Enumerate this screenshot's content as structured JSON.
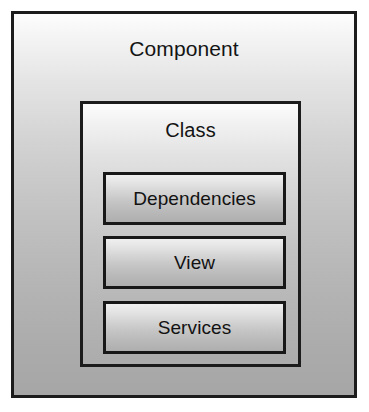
{
  "diagram": {
    "outer": {
      "label": "Component",
      "border_color": "#1c1c1c",
      "fill_top": "#fdfdfd",
      "fill_bottom": "#a6a6a6"
    },
    "middle": {
      "label": "Class",
      "border_color": "#1c1c1c",
      "fill_top": "#fcfcfc",
      "fill_bottom": "#acacac"
    },
    "inner": [
      {
        "label": "Dependencies",
        "border_color": "#181818",
        "fill_top": "#f0f0f0",
        "fill_bottom": "#aeaeae"
      },
      {
        "label": "View",
        "border_color": "#181818",
        "fill_top": "#f0f0f0",
        "fill_bottom": "#aeaeae"
      },
      {
        "label": "Services",
        "border_color": "#181818",
        "fill_top": "#f0f0f0",
        "fill_bottom": "#aeaeae"
      }
    ],
    "background_color": "#ffffff"
  }
}
